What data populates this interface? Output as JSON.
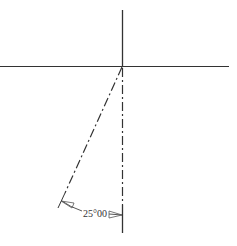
{
  "diagram": {
    "type": "cad-angular-dimension",
    "colors": {
      "background": "#ffffff",
      "line": "#333333",
      "arrow": "#555555"
    },
    "dimension": {
      "label": "25°00",
      "angle_degrees": 25
    },
    "elements": {
      "horizontal_line": "solid reference line",
      "vertical_line": "solid reference line",
      "slanted_centerline": "dash-dot line at 25° from vertical",
      "vertical_centerline": "dash-dot line",
      "dimension_arc": "angular dimension with open arrowheads"
    }
  }
}
